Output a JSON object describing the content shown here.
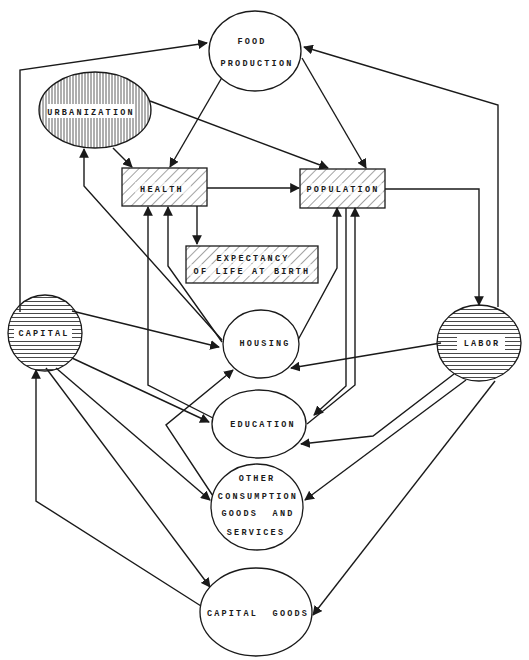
{
  "diagram": {
    "type": "causal-flow",
    "nodes": {
      "food_production": {
        "lines": [
          "FOOD",
          "PRODUCTION"
        ],
        "shape": "ellipse",
        "fill": "none"
      },
      "urbanization": {
        "lines": [
          "URBANIZATION"
        ],
        "shape": "ellipse",
        "fill": "vertical-hatch"
      },
      "health": {
        "lines": [
          "HEALTH"
        ],
        "shape": "rect",
        "fill": "diagonal-hatch"
      },
      "population": {
        "lines": [
          "POPULATION"
        ],
        "shape": "rect",
        "fill": "diagonal-hatch"
      },
      "life_expectancy": {
        "lines": [
          "EXPECTANCY",
          "OF LIFE AT BIRTH"
        ],
        "shape": "rect",
        "fill": "diagonal-hatch"
      },
      "capital": {
        "lines": [
          "CAPITAL"
        ],
        "shape": "ellipse",
        "fill": "horizontal-hatch"
      },
      "housing": {
        "lines": [
          "HOUSING"
        ],
        "shape": "ellipse",
        "fill": "none"
      },
      "labor": {
        "lines": [
          "LABOR"
        ],
        "shape": "ellipse",
        "fill": "horizontal-hatch"
      },
      "education": {
        "lines": [
          "EDUCATION"
        ],
        "shape": "ellipse",
        "fill": "none"
      },
      "other_consumption": {
        "lines": [
          "OTHER",
          "CONSUMPTION",
          "GOODS AND",
          "SERVICES"
        ],
        "shape": "ellipse",
        "fill": "none"
      },
      "capital_goods": {
        "lines": [
          "CAPITAL GOODS"
        ],
        "shape": "ellipse",
        "fill": "none"
      }
    },
    "edges": [
      {
        "from": "capital",
        "to": "food_production"
      },
      {
        "from": "labor",
        "to": "food_production"
      },
      {
        "from": "food_production",
        "to": "health"
      },
      {
        "from": "food_production",
        "to": "population"
      },
      {
        "from": "urbanization",
        "to": "health"
      },
      {
        "from": "urbanization",
        "to": "population"
      },
      {
        "from": "health",
        "to": "population"
      },
      {
        "from": "health",
        "to": "life_expectancy"
      },
      {
        "from": "population",
        "to": "labor"
      },
      {
        "from": "housing",
        "to": "urbanization"
      },
      {
        "from": "housing",
        "to": "health"
      },
      {
        "from": "housing",
        "to": "population"
      },
      {
        "from": "education",
        "to": "health"
      },
      {
        "from": "education",
        "to": "population"
      },
      {
        "from": "population",
        "to": "education"
      },
      {
        "from": "capital",
        "to": "housing"
      },
      {
        "from": "capital",
        "to": "education"
      },
      {
        "from": "capital",
        "to": "other_consumption"
      },
      {
        "from": "capital",
        "to": "capital_goods"
      },
      {
        "from": "capital_goods",
        "to": "capital"
      },
      {
        "from": "labor",
        "to": "housing"
      },
      {
        "from": "labor",
        "to": "education"
      },
      {
        "from": "labor",
        "to": "other_consumption"
      },
      {
        "from": "labor",
        "to": "capital_goods"
      },
      {
        "from": "other_consumption",
        "to": "housing"
      }
    ]
  },
  "labels": {
    "food_1": "FOOD",
    "food_2": "PRODUCTION",
    "urbanization": "URBANIZATION",
    "health": "HEALTH",
    "population": "POPULATION",
    "expectancy_1": "EXPECTANCY",
    "expectancy_2": "OF LIFE AT BIRTH",
    "capital": "CAPITAL",
    "housing": "HOUSING",
    "labor": "LABOR",
    "education": "EDUCATION",
    "other_1": "OTHER",
    "other_2": "CONSUMPTION",
    "other_3": "GOODS  AND",
    "other_4": "SERVICES",
    "capital_goods": "CAPITAL  GOODS"
  }
}
